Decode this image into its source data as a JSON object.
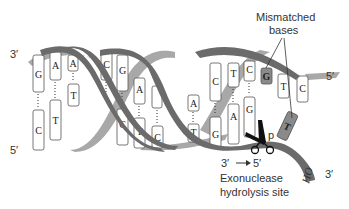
{
  "diagram": {
    "strand_ends": {
      "top_left": "3′",
      "bottom_left": "5′",
      "top_right": "5′",
      "bottom_right": "3′"
    },
    "labels": {
      "mismatched_line1": "Mismatched",
      "mismatched_line2": "bases",
      "direction_from": "3′",
      "direction_to": "5′",
      "exonuclease": "Exonuclease",
      "hydrolysis": "hydrolysis site",
      "hydroxyl": "HO",
      "phosphate": "p"
    },
    "bases": {
      "top_strand": [
        "G",
        "A",
        "A",
        "C",
        "G",
        "A",
        "G",
        "A",
        "C",
        "T",
        "C",
        "G",
        "T",
        "C"
      ],
      "bottom_strand": [
        "C",
        "T",
        "T",
        "G",
        "C",
        "T",
        "C",
        "T",
        "G",
        "A",
        "G",
        "T"
      ],
      "mismatched": [
        "G",
        "T"
      ]
    },
    "colors": {
      "dark_strand": "#6b6b6b",
      "light_strand": "#a8a8a8",
      "base_fill": "#ffffff",
      "mismatch_fill": "#8a8a8a",
      "text": "#333333"
    }
  }
}
